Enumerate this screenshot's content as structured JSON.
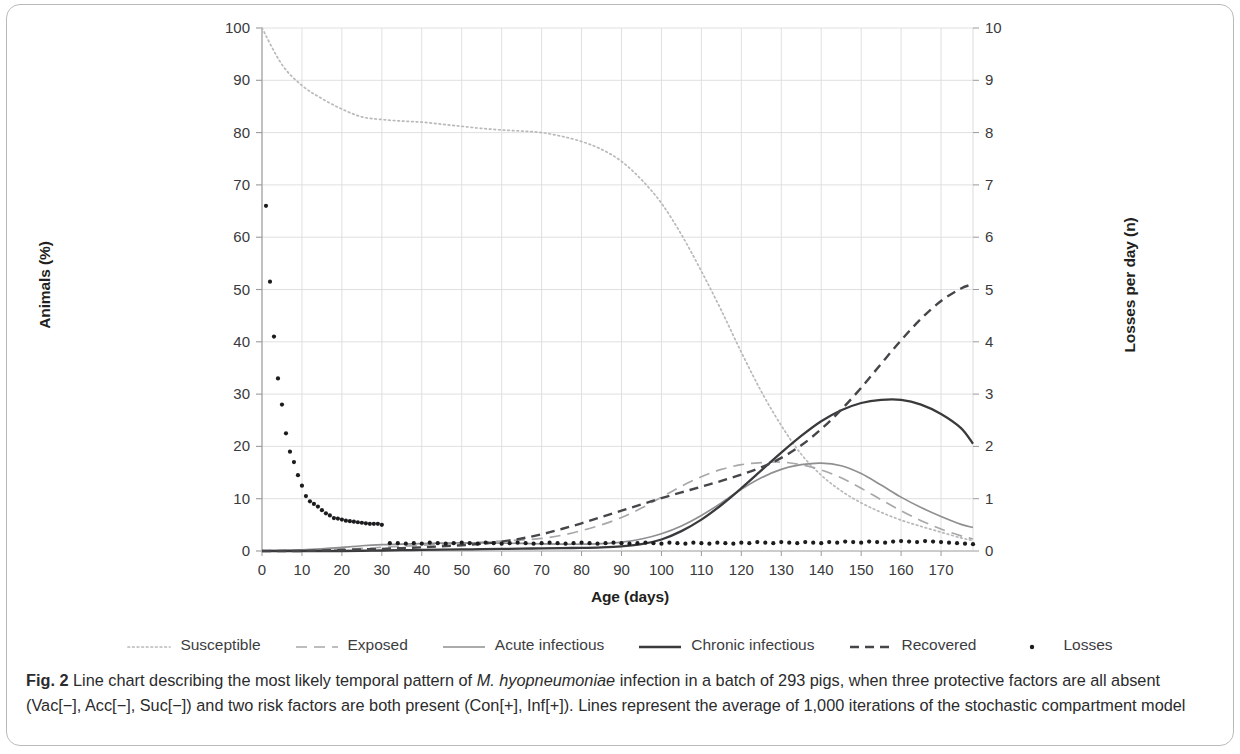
{
  "figure": {
    "label": "Fig. 2",
    "caption_parts": [
      {
        "text": "Fig. 2 ",
        "style": "bold"
      },
      {
        "text": "Line chart describing the most likely temporal pattern of ",
        "style": "normal"
      },
      {
        "text": "M. hyopneumoniae",
        "style": "italic"
      },
      {
        "text": " infection in a batch of 293 pigs, when three protective factors are all absent (Vac[−], Acc[−], Suc[−]) and two risk factors are both present (Con[+], Inf[+]). Lines represent the average of 1,000 iterations of the stochastic compartment model",
        "style": "normal"
      }
    ],
    "caption_plain": "Fig. 2 Line chart describing the most likely temporal pattern of M. hyopneumoniae infection in a batch of 293 pigs, when three protective factors are all absent (Vac[−], Acc[−], Suc[−]) and two risk factors are both present (Con[+], Inf[+]). Lines represent the average of 1,000 iterations of the stochastic compartment model"
  },
  "chart_data": {
    "type": "line",
    "title": "",
    "xlabel": "Age (days)",
    "ylabel": "Animals (%)",
    "y2label": "Losses per day (n)",
    "xlim": [
      0,
      178
    ],
    "ylim": [
      0,
      100
    ],
    "y2lim": [
      0,
      10
    ],
    "xticks": [
      0,
      10,
      20,
      30,
      40,
      50,
      60,
      70,
      80,
      90,
      100,
      110,
      120,
      130,
      140,
      150,
      160,
      170
    ],
    "yticks": [
      0,
      10,
      20,
      30,
      40,
      50,
      60,
      70,
      80,
      90,
      100
    ],
    "y2ticks": [
      0,
      1,
      2,
      3,
      4,
      5,
      6,
      7,
      8,
      9,
      10
    ],
    "grid": "horizontal-and-vertical",
    "legend_position": "bottom",
    "series": [
      {
        "name": "Susceptible",
        "axis": "left",
        "style": "dotted",
        "color": "#b9b9bb",
        "x": [
          0,
          5,
          10,
          15,
          20,
          25,
          30,
          35,
          40,
          45,
          50,
          55,
          60,
          65,
          70,
          75,
          80,
          85,
          90,
          95,
          100,
          105,
          110,
          115,
          120,
          125,
          130,
          135,
          140,
          145,
          150,
          155,
          160,
          165,
          170,
          175,
          178
        ],
        "values": [
          100,
          93,
          89,
          86.5,
          84.5,
          83,
          82.5,
          82.2,
          82,
          81.6,
          81.2,
          80.8,
          80.5,
          80.3,
          80,
          79.3,
          78.3,
          76.8,
          74.5,
          71,
          66.5,
          60.5,
          53.5,
          46,
          38,
          30.5,
          24,
          18.5,
          14.5,
          11.5,
          9.2,
          7.4,
          5.9,
          4.7,
          3.6,
          2.5,
          2.0
        ]
      },
      {
        "name": "Exposed",
        "axis": "left",
        "style": "dashed-long",
        "color": "#a8a8aa",
        "x": [
          0,
          5,
          10,
          15,
          20,
          25,
          30,
          35,
          40,
          45,
          50,
          55,
          60,
          65,
          70,
          75,
          80,
          85,
          90,
          95,
          100,
          105,
          110,
          115,
          120,
          125,
          130,
          135,
          140,
          145,
          150,
          155,
          160,
          165,
          170,
          175,
          178
        ],
        "values": [
          0,
          0.1,
          0.2,
          0.3,
          0.4,
          0.5,
          0.7,
          0.9,
          1.1,
          1.3,
          1.5,
          1.7,
          1.9,
          2.1,
          2.4,
          3.0,
          3.9,
          5.0,
          6.4,
          8.2,
          10.3,
          12.4,
          14.2,
          15.6,
          16.5,
          16.9,
          17.0,
          16.5,
          15.5,
          14.0,
          12.0,
          9.8,
          7.7,
          5.8,
          4.2,
          2.9,
          2.3
        ]
      },
      {
        "name": "Acute infectious",
        "axis": "left",
        "style": "solid-light",
        "color": "#8f8f91",
        "x": [
          0,
          5,
          10,
          15,
          20,
          25,
          30,
          35,
          40,
          45,
          50,
          55,
          60,
          65,
          70,
          75,
          80,
          85,
          90,
          95,
          100,
          105,
          110,
          115,
          120,
          125,
          130,
          135,
          140,
          145,
          150,
          155,
          160,
          165,
          170,
          175,
          178
        ],
        "values": [
          0,
          0.1,
          0.2,
          0.4,
          0.7,
          1.0,
          1.2,
          1.3,
          1.4,
          1.5,
          1.55,
          1.55,
          1.5,
          1.45,
          1.35,
          1.3,
          1.3,
          1.4,
          1.7,
          2.3,
          3.3,
          4.8,
          6.8,
          9.2,
          11.8,
          14.0,
          15.6,
          16.5,
          16.8,
          16.3,
          14.8,
          12.6,
          10.3,
          8.3,
          6.6,
          5.1,
          4.5
        ]
      },
      {
        "name": "Chronic infectious",
        "axis": "left",
        "style": "solid-dark",
        "color": "#3a3a3c",
        "x": [
          0,
          5,
          10,
          15,
          20,
          25,
          30,
          35,
          40,
          45,
          50,
          55,
          60,
          65,
          70,
          75,
          80,
          85,
          90,
          95,
          100,
          105,
          110,
          115,
          120,
          125,
          130,
          135,
          140,
          145,
          150,
          155,
          160,
          165,
          170,
          175,
          178
        ],
        "values": [
          0,
          0,
          0,
          0,
          0,
          0.05,
          0.1,
          0.15,
          0.2,
          0.25,
          0.3,
          0.35,
          0.4,
          0.45,
          0.5,
          0.55,
          0.6,
          0.7,
          0.9,
          1.3,
          2.2,
          3.8,
          6.0,
          8.8,
          12.0,
          15.4,
          18.8,
          22.0,
          24.8,
          26.9,
          28.3,
          28.9,
          28.9,
          28.0,
          26.2,
          23.5,
          20.5
        ]
      },
      {
        "name": "Recovered",
        "axis": "left",
        "style": "dashed-dark",
        "color": "#46464a",
        "x": [
          0,
          5,
          10,
          15,
          20,
          25,
          30,
          35,
          40,
          45,
          50,
          55,
          60,
          65,
          70,
          75,
          80,
          85,
          90,
          95,
          100,
          105,
          110,
          115,
          120,
          125,
          130,
          135,
          140,
          145,
          150,
          155,
          160,
          165,
          170,
          175,
          178
        ],
        "values": [
          0,
          0,
          0,
          0.1,
          0.2,
          0.3,
          0.4,
          0.55,
          0.7,
          0.9,
          1.1,
          1.4,
          1.8,
          2.4,
          3.2,
          4.2,
          5.3,
          6.5,
          7.7,
          8.9,
          10.1,
          11.2,
          12.3,
          13.4,
          14.6,
          16.0,
          17.8,
          20.2,
          23.3,
          27.0,
          31.2,
          35.8,
          40.3,
          44.4,
          47.8,
          50.2,
          51.0
        ]
      },
      {
        "name": "Losses",
        "axis": "right",
        "style": "scatter",
        "color": "#1c1c1e",
        "x": [
          1,
          2,
          3,
          4,
          5,
          6,
          7,
          8,
          9,
          10,
          11,
          12,
          13,
          14,
          15,
          16,
          17,
          18,
          19,
          20,
          21,
          22,
          23,
          24,
          25,
          26,
          27,
          28,
          29,
          30,
          32,
          34,
          36,
          38,
          40,
          42,
          44,
          46,
          48,
          50,
          52,
          54,
          56,
          58,
          60,
          62,
          64,
          66,
          68,
          70,
          72,
          74,
          76,
          78,
          80,
          82,
          84,
          86,
          88,
          90,
          92,
          94,
          96,
          98,
          100,
          102,
          104,
          106,
          108,
          110,
          112,
          114,
          116,
          118,
          120,
          122,
          124,
          126,
          128,
          130,
          132,
          134,
          136,
          138,
          140,
          142,
          144,
          146,
          148,
          150,
          152,
          154,
          156,
          158,
          160,
          162,
          164,
          166,
          168,
          170,
          172,
          174,
          176,
          178
        ],
        "values": [
          6.6,
          5.15,
          4.1,
          3.3,
          2.8,
          2.25,
          1.9,
          1.7,
          1.45,
          1.25,
          1.05,
          0.95,
          0.9,
          0.85,
          0.78,
          0.72,
          0.68,
          0.63,
          0.62,
          0.6,
          0.58,
          0.57,
          0.56,
          0.55,
          0.54,
          0.53,
          0.52,
          0.52,
          0.52,
          0.5,
          0.15,
          0.15,
          0.14,
          0.15,
          0.14,
          0.16,
          0.15,
          0.14,
          0.15,
          0.16,
          0.15,
          0.14,
          0.16,
          0.15,
          0.14,
          0.15,
          0.16,
          0.15,
          0.14,
          0.15,
          0.16,
          0.15,
          0.14,
          0.15,
          0.16,
          0.15,
          0.14,
          0.15,
          0.16,
          0.15,
          0.14,
          0.15,
          0.16,
          0.15,
          0.14,
          0.16,
          0.15,
          0.14,
          0.16,
          0.15,
          0.14,
          0.16,
          0.15,
          0.14,
          0.16,
          0.15,
          0.17,
          0.16,
          0.15,
          0.17,
          0.16,
          0.15,
          0.17,
          0.16,
          0.15,
          0.17,
          0.16,
          0.18,
          0.17,
          0.16,
          0.18,
          0.17,
          0.16,
          0.18,
          0.19,
          0.18,
          0.17,
          0.19,
          0.18,
          0.17,
          0.16,
          0.15,
          0.14,
          0.13
        ]
      }
    ]
  },
  "legend": {
    "items": [
      {
        "label": "Susceptible",
        "style": "dotted",
        "color": "#b9b9bb"
      },
      {
        "label": "Exposed",
        "style": "dashed-long",
        "color": "#a8a8aa"
      },
      {
        "label": "Acute infectious",
        "style": "solid-light",
        "color": "#8f8f91"
      },
      {
        "label": "Chronic infectious",
        "style": "solid-dark",
        "color": "#3a3a3c"
      },
      {
        "label": "Recovered",
        "style": "dashed-dark",
        "color": "#46464a"
      },
      {
        "label": "Losses",
        "style": "scatter",
        "color": "#1c1c1e"
      }
    ]
  },
  "colors": {
    "frame": "#b9babc",
    "grid": "#dcdcde",
    "axis": "#9a9a9c",
    "text": "#231f20"
  }
}
